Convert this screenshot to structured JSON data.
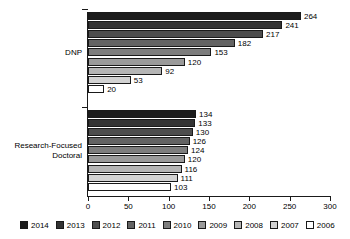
{
  "chart_data": {
    "type": "bar",
    "orientation": "horizontal",
    "title": "",
    "xlabel": "",
    "ylabel": "",
    "categories": [
      "DNP",
      "Research-Focused Doctoral"
    ],
    "category_labels": [
      [
        "DNP"
      ],
      [
        "Research-Focused",
        "Doctoral"
      ]
    ],
    "series": [
      {
        "name": "2014",
        "color": "#1c1c1c",
        "values": [
          264,
          134
        ]
      },
      {
        "name": "2013",
        "color": "#333333",
        "values": [
          241,
          133
        ]
      },
      {
        "name": "2012",
        "color": "#4d4d4d",
        "values": [
          217,
          130
        ]
      },
      {
        "name": "2011",
        "color": "#636363",
        "values": [
          182,
          126
        ]
      },
      {
        "name": "2010",
        "color": "#7d7d7d",
        "values": [
          153,
          124
        ]
      },
      {
        "name": "2009",
        "color": "#9a9a9a",
        "values": [
          120,
          120
        ]
      },
      {
        "name": "2008",
        "color": "#b5b5b5",
        "values": [
          92,
          116
        ]
      },
      {
        "name": "2007",
        "color": "#d2d2d2",
        "values": [
          53,
          111
        ]
      },
      {
        "name": "2006",
        "color": "#ffffff",
        "values": [
          20,
          103
        ]
      }
    ],
    "xlim": [
      0,
      300
    ],
    "xticks": [
      0,
      50,
      100,
      150,
      200,
      250,
      300
    ],
    "xtick_labels": [
      "0",
      "50",
      "100",
      "150",
      "200",
      "250",
      "300"
    ],
    "grid": false,
    "legend_position": "bottom",
    "show_value_labels": true,
    "axis_color": "#1a1a1a"
  }
}
